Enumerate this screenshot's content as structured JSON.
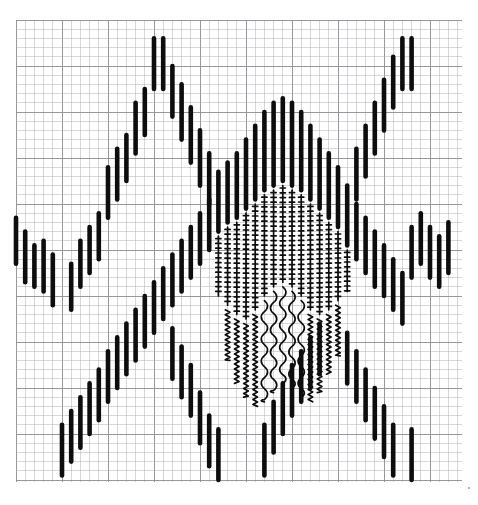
{
  "document": {
    "title": "Graph Paper Column Plot",
    "media": "engineering graph paper",
    "background_color": "#ffffff",
    "ink_color": "#0d0d0d",
    "grid_color": "#a7a7ad",
    "grid_major_color": "#8c8c94"
  },
  "grid": {
    "x0": 16,
    "y0": 20,
    "x1": 462,
    "y1": 482,
    "cell": 9.2,
    "major_every": 5,
    "minor_width": 0.6,
    "major_width": 0.95,
    "cols": 48,
    "rows": 50,
    "show": true
  },
  "glyphs": {
    "bar": {
      "name": "solid-bar",
      "stroke": 4.6,
      "description": "thick solid vertical bar"
    },
    "ladder": {
      "name": "cross-hatch-ladder",
      "stroke": 1.7,
      "tick_stroke": 1.7,
      "tick_half_width": 2.6,
      "tick_spacing": 4.8,
      "description": "thin vertical line with short horizontal cross ticks"
    },
    "zigzag": {
      "name": "tight-zigzag",
      "stroke": 1.7,
      "amplitude": 2.3,
      "period": 5.0,
      "description": "tight vertical zigzag squiggle"
    },
    "wave": {
      "name": "smooth-s-wave",
      "stroke": 1.7,
      "amplitude": 4.2,
      "period": 22.0,
      "description": "smooth large-amplitude sine wave"
    }
  },
  "chart_data": {
    "type": "bar",
    "title": "",
    "subtitle": "",
    "xlabel": "",
    "ylabel": "",
    "orientation": "vertical",
    "xlim": [
      0,
      48
    ],
    "ylim": [
      0,
      50
    ],
    "grid": true,
    "legend": null,
    "columns": [
      {
        "x": 0,
        "marks": [
          {
            "style": "bar",
            "top": 21.5,
            "bottom": 26.5
          }
        ]
      },
      {
        "x": 1,
        "marks": [
          {
            "style": "bar",
            "top": 23.0,
            "bottom": 28.5
          }
        ]
      },
      {
        "x": 2,
        "marks": [
          {
            "style": "bar",
            "top": 24.5,
            "bottom": 29.0
          }
        ]
      },
      {
        "x": 3,
        "marks": [
          {
            "style": "bar",
            "top": 24.0,
            "bottom": 29.5
          }
        ]
      },
      {
        "x": 4,
        "marks": [
          {
            "style": "bar",
            "top": 25.5,
            "bottom": 31.0
          }
        ]
      },
      {
        "x": 5,
        "marks": [
          {
            "style": "bar",
            "top": 44.0,
            "bottom": 49.5
          }
        ]
      },
      {
        "x": 6,
        "marks": [
          {
            "style": "bar",
            "top": 42.5,
            "bottom": 48.0
          },
          {
            "style": "bar",
            "top": 26.5,
            "bottom": 31.5
          }
        ]
      },
      {
        "x": 7,
        "marks": [
          {
            "style": "bar",
            "top": 41.0,
            "bottom": 46.5
          },
          {
            "style": "bar",
            "top": 24.0,
            "bottom": 29.0
          }
        ]
      },
      {
        "x": 8,
        "marks": [
          {
            "style": "bar",
            "top": 39.5,
            "bottom": 45.0
          },
          {
            "style": "bar",
            "top": 22.5,
            "bottom": 27.5
          }
        ]
      },
      {
        "x": 9,
        "marks": [
          {
            "style": "bar",
            "top": 38.0,
            "bottom": 43.5
          },
          {
            "style": "bar",
            "top": 21.0,
            "bottom": 26.0
          }
        ]
      },
      {
        "x": 10,
        "marks": [
          {
            "style": "bar",
            "top": 36.0,
            "bottom": 41.5
          },
          {
            "style": "bar",
            "top": 16.0,
            "bottom": 21.5
          }
        ]
      },
      {
        "x": 11,
        "marks": [
          {
            "style": "bar",
            "top": 34.5,
            "bottom": 40.0
          },
          {
            "style": "bar",
            "top": 14.0,
            "bottom": 19.5
          }
        ]
      },
      {
        "x": 12,
        "marks": [
          {
            "style": "bar",
            "top": 33.0,
            "bottom": 38.5
          },
          {
            "style": "bar",
            "top": 12.5,
            "bottom": 17.5
          }
        ]
      },
      {
        "x": 13,
        "marks": [
          {
            "style": "bar",
            "top": 31.5,
            "bottom": 37.0
          },
          {
            "style": "bar",
            "top": 9.0,
            "bottom": 14.5
          }
        ]
      },
      {
        "x": 14,
        "marks": [
          {
            "style": "bar",
            "top": 30.0,
            "bottom": 35.5
          },
          {
            "style": "bar",
            "top": 7.5,
            "bottom": 12.5
          }
        ]
      },
      {
        "x": 15,
        "marks": [
          {
            "style": "bar",
            "top": 28.5,
            "bottom": 34.0
          },
          {
            "style": "bar",
            "top": 2.0,
            "bottom": 7.5
          }
        ]
      },
      {
        "x": 16,
        "marks": [
          {
            "style": "bar",
            "top": 27.0,
            "bottom": 32.5
          },
          {
            "style": "bar",
            "top": 2.0,
            "bottom": 7.5
          }
        ]
      },
      {
        "x": 17,
        "marks": [
          {
            "style": "bar",
            "top": 25.5,
            "bottom": 31.0
          },
          {
            "style": "bar",
            "top": 5.0,
            "bottom": 10.5
          }
        ]
      },
      {
        "x": 18,
        "marks": [
          {
            "style": "bar",
            "top": 24.0,
            "bottom": 29.5
          },
          {
            "style": "bar",
            "top": 7.0,
            "bottom": 13.0
          }
        ]
      },
      {
        "x": 19,
        "marks": [
          {
            "style": "bar",
            "top": 22.5,
            "bottom": 28.0
          },
          {
            "style": "bar",
            "top": 9.5,
            "bottom": 15.5
          }
        ]
      },
      {
        "x": 20,
        "marks": [
          {
            "style": "bar",
            "top": 21.0,
            "bottom": 26.5
          },
          {
            "style": "bar",
            "top": 12.0,
            "bottom": 18.0
          }
        ]
      },
      {
        "x": 21,
        "marks": [
          {
            "style": "bar",
            "top": 19.5,
            "bottom": 25.0
          },
          {
            "style": "bar",
            "top": 14.5,
            "bottom": 20.0
          }
        ]
      },
      {
        "x": 22,
        "marks": [
          {
            "style": "bar",
            "top": 16.5,
            "bottom": 23.0
          },
          {
            "style": "ladder",
            "top": 23.5,
            "bottom": 30.0
          }
        ]
      },
      {
        "x": 23,
        "marks": [
          {
            "style": "bar",
            "top": 15.5,
            "bottom": 22.0
          },
          {
            "style": "ladder",
            "top": 22.5,
            "bottom": 31.0
          },
          {
            "style": "zigzag",
            "top": 31.5,
            "bottom": 37.0
          }
        ]
      },
      {
        "x": 24,
        "marks": [
          {
            "style": "bar",
            "top": 14.5,
            "bottom": 21.5
          },
          {
            "style": "ladder",
            "top": 22.0,
            "bottom": 32.0
          },
          {
            "style": "zigzag",
            "top": 32.5,
            "bottom": 39.5
          }
        ]
      },
      {
        "x": 25,
        "marks": [
          {
            "style": "bar",
            "top": 13.0,
            "bottom": 20.5
          },
          {
            "style": "ladder",
            "top": 21.0,
            "bottom": 32.5
          },
          {
            "style": "zigzag",
            "top": 33.0,
            "bottom": 41.0
          }
        ]
      },
      {
        "x": 26,
        "marks": [
          {
            "style": "bar",
            "top": 11.5,
            "bottom": 19.5
          },
          {
            "style": "ladder",
            "top": 20.0,
            "bottom": 31.5
          },
          {
            "style": "zigzag",
            "top": 32.0,
            "bottom": 42.0
          }
        ]
      },
      {
        "x": 27,
        "marks": [
          {
            "style": "bar",
            "top": 10.0,
            "bottom": 18.5
          },
          {
            "style": "ladder",
            "top": 19.0,
            "bottom": 30.0
          },
          {
            "style": "wave",
            "top": 30.5,
            "bottom": 41.5
          }
        ]
      },
      {
        "x": 28,
        "marks": [
          {
            "style": "bar",
            "top": 9.0,
            "bottom": 18.0
          },
          {
            "style": "ladder",
            "top": 18.5,
            "bottom": 29.0
          },
          {
            "style": "wave",
            "top": 29.5,
            "bottom": 40.5
          }
        ]
      },
      {
        "x": 29,
        "marks": [
          {
            "style": "bar",
            "top": 8.5,
            "bottom": 17.5
          },
          {
            "style": "ladder",
            "top": 18.0,
            "bottom": 28.5
          },
          {
            "style": "wave",
            "top": 29.0,
            "bottom": 39.5
          }
        ]
      },
      {
        "x": 30,
        "marks": [
          {
            "style": "bar",
            "top": 9.0,
            "bottom": 18.0
          },
          {
            "style": "ladder",
            "top": 18.5,
            "bottom": 29.0
          },
          {
            "style": "wave",
            "top": 29.5,
            "bottom": 40.0
          }
        ]
      },
      {
        "x": 31,
        "marks": [
          {
            "style": "bar",
            "top": 10.0,
            "bottom": 18.5
          },
          {
            "style": "ladder",
            "top": 19.0,
            "bottom": 30.0
          },
          {
            "style": "wave",
            "top": 30.5,
            "bottom": 41.0
          }
        ]
      },
      {
        "x": 32,
        "marks": [
          {
            "style": "bar",
            "top": 11.5,
            "bottom": 19.5
          },
          {
            "style": "ladder",
            "top": 20.0,
            "bottom": 31.5
          },
          {
            "style": "zigzag",
            "top": 32.0,
            "bottom": 41.5
          }
        ]
      },
      {
        "x": 33,
        "marks": [
          {
            "style": "bar",
            "top": 13.0,
            "bottom": 20.5
          },
          {
            "style": "ladder",
            "top": 21.0,
            "bottom": 32.0
          },
          {
            "style": "zigzag",
            "top": 32.5,
            "bottom": 40.5
          }
        ]
      },
      {
        "x": 34,
        "marks": [
          {
            "style": "bar",
            "top": 14.5,
            "bottom": 21.5
          },
          {
            "style": "ladder",
            "top": 22.0,
            "bottom": 31.5
          },
          {
            "style": "zigzag",
            "top": 32.0,
            "bottom": 38.5
          }
        ]
      },
      {
        "x": 35,
        "marks": [
          {
            "style": "bar",
            "top": 16.0,
            "bottom": 22.5
          },
          {
            "style": "ladder",
            "top": 23.0,
            "bottom": 30.5
          },
          {
            "style": "zigzag",
            "top": 31.0,
            "bottom": 36.5
          }
        ]
      },
      {
        "x": 36,
        "marks": [
          {
            "style": "bar",
            "top": 18.0,
            "bottom": 24.5
          },
          {
            "style": "ladder",
            "top": 25.0,
            "bottom": 29.5
          }
        ]
      },
      {
        "x": 37,
        "marks": [
          {
            "style": "bar",
            "top": 20.0,
            "bottom": 26.0
          },
          {
            "style": "bar",
            "top": 14.0,
            "bottom": 19.5
          }
        ]
      },
      {
        "x": 38,
        "marks": [
          {
            "style": "bar",
            "top": 21.5,
            "bottom": 27.5
          },
          {
            "style": "bar",
            "top": 11.5,
            "bottom": 17.0
          }
        ]
      },
      {
        "x": 39,
        "marks": [
          {
            "style": "bar",
            "top": 23.0,
            "bottom": 29.0
          },
          {
            "style": "bar",
            "top": 9.0,
            "bottom": 14.5
          }
        ]
      },
      {
        "x": 40,
        "marks": [
          {
            "style": "bar",
            "top": 24.5,
            "bottom": 30.0
          },
          {
            "style": "bar",
            "top": 6.5,
            "bottom": 12.0
          }
        ]
      },
      {
        "x": 41,
        "marks": [
          {
            "style": "bar",
            "top": 26.0,
            "bottom": 31.5
          },
          {
            "style": "bar",
            "top": 4.0,
            "bottom": 9.5
          }
        ]
      },
      {
        "x": 42,
        "marks": [
          {
            "style": "bar",
            "top": 27.5,
            "bottom": 33.0
          },
          {
            "style": "bar",
            "top": 2.0,
            "bottom": 7.5
          }
        ]
      },
      {
        "x": 43,
        "marks": [
          {
            "style": "bar",
            "top": 22.5,
            "bottom": 28.0
          },
          {
            "style": "bar",
            "top": 2.0,
            "bottom": 7.5
          }
        ]
      },
      {
        "x": 44,
        "marks": [
          {
            "style": "bar",
            "top": 21.0,
            "bottom": 26.5
          }
        ]
      },
      {
        "x": 45,
        "marks": [
          {
            "style": "bar",
            "top": 22.5,
            "bottom": 28.0
          }
        ]
      },
      {
        "x": 46,
        "marks": [
          {
            "style": "bar",
            "top": 23.5,
            "bottom": 29.0
          }
        ]
      },
      {
        "x": 47,
        "marks": [
          {
            "style": "bar",
            "top": 22.0,
            "bottom": 27.5
          }
        ]
      }
    ],
    "lower_columns": [
      {
        "x": 17,
        "marks": [
          {
            "style": "bar",
            "top": 33.5,
            "bottom": 39.0
          }
        ]
      },
      {
        "x": 18,
        "marks": [
          {
            "style": "bar",
            "top": 35.5,
            "bottom": 41.0
          }
        ]
      },
      {
        "x": 19,
        "marks": [
          {
            "style": "bar",
            "top": 37.5,
            "bottom": 43.0
          }
        ]
      },
      {
        "x": 20,
        "marks": [
          {
            "style": "bar",
            "top": 40.5,
            "bottom": 46.0
          }
        ]
      },
      {
        "x": 21,
        "marks": [
          {
            "style": "bar",
            "top": 43.0,
            "bottom": 48.5
          }
        ]
      },
      {
        "x": 22,
        "marks": [
          {
            "style": "bar",
            "top": 44.5,
            "bottom": 50.0
          }
        ]
      },
      {
        "x": 27,
        "marks": [
          {
            "style": "bar",
            "top": 44.0,
            "bottom": 49.5
          }
        ]
      },
      {
        "x": 28,
        "marks": [
          {
            "style": "bar",
            "top": 41.5,
            "bottom": 47.0
          }
        ]
      },
      {
        "x": 29,
        "marks": [
          {
            "style": "bar",
            "top": 39.5,
            "bottom": 45.0
          }
        ]
      },
      {
        "x": 30,
        "marks": [
          {
            "style": "bar",
            "top": 37.5,
            "bottom": 43.0
          }
        ]
      },
      {
        "x": 31,
        "marks": [
          {
            "style": "bar",
            "top": 36.0,
            "bottom": 41.5
          }
        ]
      },
      {
        "x": 32,
        "marks": [
          {
            "style": "bar",
            "top": 34.5,
            "bottom": 40.0
          }
        ]
      },
      {
        "x": 33,
        "marks": [
          {
            "style": "bar",
            "top": 33.0,
            "bottom": 38.5
          }
        ]
      },
      {
        "x": 36,
        "marks": [
          {
            "style": "bar",
            "top": 34.0,
            "bottom": 39.5
          }
        ]
      },
      {
        "x": 37,
        "marks": [
          {
            "style": "bar",
            "top": 36.0,
            "bottom": 41.5
          }
        ]
      },
      {
        "x": 38,
        "marks": [
          {
            "style": "bar",
            "top": 38.0,
            "bottom": 43.5
          }
        ]
      },
      {
        "x": 39,
        "marks": [
          {
            "style": "bar",
            "top": 40.0,
            "bottom": 45.5
          }
        ]
      },
      {
        "x": 40,
        "marks": [
          {
            "style": "bar",
            "top": 42.0,
            "bottom": 47.5
          }
        ]
      },
      {
        "x": 41,
        "marks": [
          {
            "style": "bar",
            "top": 44.0,
            "bottom": 49.5
          }
        ]
      },
      {
        "x": 43,
        "marks": [
          {
            "style": "bar",
            "top": 44.5,
            "bottom": 50.0
          }
        ]
      }
    ]
  },
  "annotations": {
    "corner_dot": {
      "name": "corner-dot",
      "x": 468,
      "y": 487,
      "visible": true
    }
  }
}
